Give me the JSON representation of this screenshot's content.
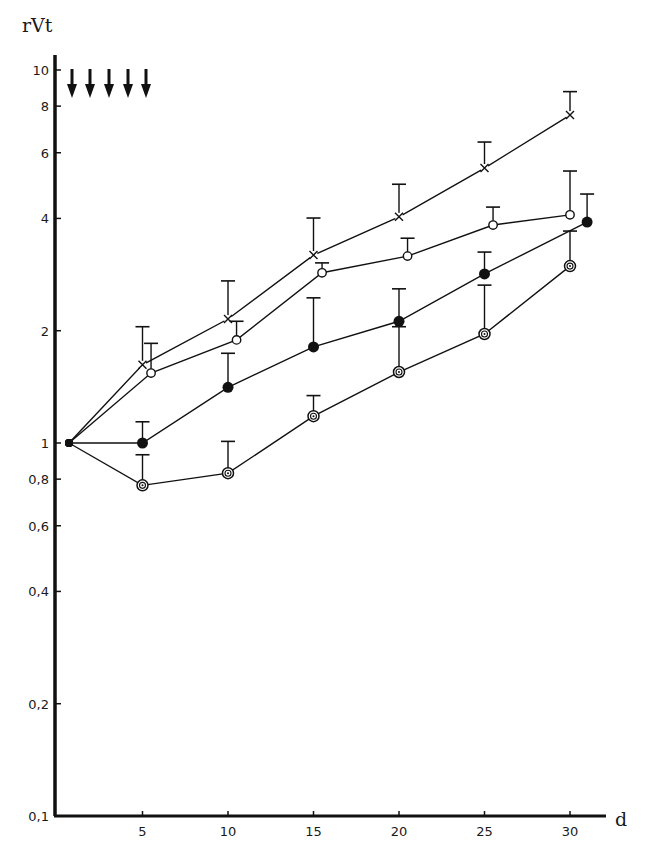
{
  "chart_data": {
    "type": "line",
    "title": "",
    "ylabel": "rVt",
    "xlabel": "d",
    "yscale": "log",
    "ylim": [
      0.1,
      11
    ],
    "xlim": [
      0,
      32
    ],
    "grid": false,
    "legend": null,
    "x_ticks": [
      5,
      10,
      15,
      20,
      25,
      30
    ],
    "x_tick_labels": [
      "5",
      "10",
      "15",
      "20",
      "25",
      "30"
    ],
    "y_ticks": [
      0.1,
      0.2,
      0.4,
      0.6,
      0.8,
      1,
      2,
      4,
      6,
      8,
      10
    ],
    "y_tick_labels": [
      "0,1",
      "0,2",
      "0,4",
      "0,6",
      "0,8",
      "1",
      "2",
      "4",
      "6",
      "8",
      "10"
    ],
    "annotations": [
      {
        "type": "arrows-down",
        "count": 5,
        "x_days": [
          1,
          2,
          3,
          4,
          5
        ],
        "note": "treatment administration markers at top of chart"
      }
    ],
    "series": [
      {
        "name": "cross",
        "marker": "x",
        "x": [
          1,
          5,
          10,
          15,
          20,
          25,
          30
        ],
        "values": [
          1.0,
          1.62,
          2.15,
          3.19,
          4.04,
          5.46,
          7.57
        ],
        "error_upper": [
          null,
          2.05,
          2.72,
          4.01,
          4.94,
          6.41,
          8.75
        ]
      },
      {
        "name": "open-circle",
        "marker": "open-circle",
        "x": [
          1,
          5.5,
          10.5,
          15.5,
          20.5,
          25.5,
          30
        ],
        "values": [
          1.0,
          1.54,
          1.89,
          2.86,
          3.17,
          3.84,
          4.09
        ],
        "error_upper": [
          null,
          1.85,
          2.12,
          3.04,
          3.54,
          4.29,
          5.36
        ]
      },
      {
        "name": "filled-circle",
        "marker": "filled-circle",
        "x": [
          1,
          5,
          10,
          15,
          20,
          25,
          31
        ],
        "values": [
          1.0,
          1.0,
          1.41,
          1.81,
          2.12,
          2.84,
          3.91
        ],
        "error_upper": [
          null,
          1.14,
          1.74,
          2.45,
          2.59,
          3.25,
          4.65
        ]
      },
      {
        "name": "target-circle",
        "marker": "double-circle",
        "x": [
          1,
          5,
          10,
          15,
          20,
          25,
          30
        ],
        "values": [
          1.0,
          0.77,
          0.83,
          1.18,
          1.55,
          1.96,
          2.98
        ],
        "error_upper": [
          null,
          0.93,
          1.01,
          1.34,
          2.05,
          2.65,
          3.7
        ]
      }
    ]
  },
  "colors": {
    "ink": "#111111",
    "background": "#ffffff"
  }
}
